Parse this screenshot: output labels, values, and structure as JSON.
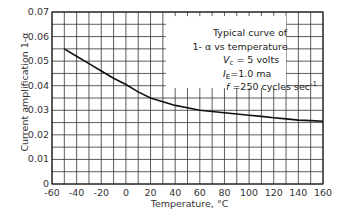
{
  "chart_data": {
    "type": "line",
    "title": "",
    "xlabel": "Temperature, °C",
    "ylabel": "Current amplification 1-α",
    "xlim": [
      -60,
      160
    ],
    "ylim": [
      0,
      0.07
    ],
    "x_ticks": [
      -60,
      -40,
      -20,
      0,
      20,
      40,
      60,
      80,
      100,
      120,
      140,
      160
    ],
    "x_tick_labels": [
      "-60",
      "-40",
      "-20",
      "0",
      "20",
      "40",
      "60",
      "80",
      "100",
      "120",
      "140",
      "160"
    ],
    "y_ticks": [
      0,
      0.01,
      0.02,
      0.03,
      0.04,
      0.05,
      0.06,
      0.07
    ],
    "y_tick_labels": [
      "0",
      "0.01",
      "0.02",
      "0.03",
      "0.04",
      "0.05",
      "0.06",
      "0.07"
    ],
    "grid": true,
    "grid_minor_x": 10,
    "grid_minor_y": 0.005,
    "series": [
      {
        "name": "1-α vs temperature",
        "x": [
          -50,
          -40,
          -30,
          -20,
          -10,
          0,
          10,
          20,
          30,
          40,
          50,
          60,
          70,
          80,
          90,
          100,
          110,
          120,
          130,
          140,
          150,
          160
        ],
        "y": [
          0.055,
          0.052,
          0.049,
          0.046,
          0.043,
          0.0405,
          0.0375,
          0.035,
          0.0335,
          0.032,
          0.031,
          0.03,
          0.0295,
          0.029,
          0.0285,
          0.028,
          0.0275,
          0.027,
          0.0265,
          0.026,
          0.0258,
          0.0255
        ]
      }
    ],
    "annotation": {
      "lines": [
        "Typical curve of",
        "1- α vs temperature",
        "Vc = 5 volts",
        "IE =1.0 ma",
        "f =250 cycles sec-1"
      ]
    }
  }
}
